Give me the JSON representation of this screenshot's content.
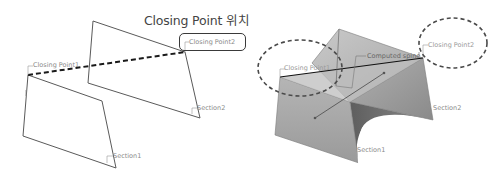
{
  "left_figure": {
    "title": "Closing Point 위치",
    "labels": {
      "closing_point1": "Closing Point1",
      "closing_point2": "Closing Point2",
      "section1": "Section1",
      "section2": "Section2"
    },
    "colors": {
      "outline": "#555555",
      "dashed_line": "#1a1a1a",
      "highlight_box": "#3a3a3a"
    }
  },
  "right_figure": {
    "labels": {
      "closing_point1": "Closing Point1",
      "closing_point2": "Closing Point2",
      "computed_spine": "Computed spine",
      "section1": "Section1",
      "section2": "Section2"
    },
    "colors": {
      "surface_light": "#b9b9b9",
      "surface_mid": "#9c9c9c",
      "surface_dark": "#6f6f6f",
      "dashed_ellipse": "#4a4a4a"
    }
  }
}
